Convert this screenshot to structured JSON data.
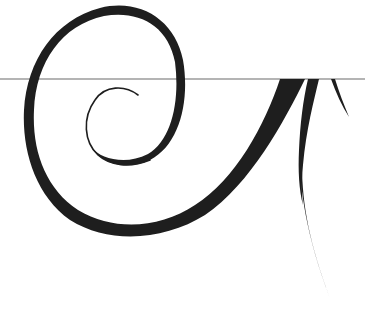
{
  "artwork": {
    "title": "Decorative swirl flourish",
    "colors": {
      "background": "#ffffff",
      "ink": "#1e1e1e",
      "rule": "#b4b4b4"
    },
    "elements": [
      {
        "name": "horizontal-rule",
        "y": 79
      },
      {
        "name": "outer-spiral-stroke"
      },
      {
        "name": "inner-spiral-stroke"
      },
      {
        "name": "diagonal-thick-stroke"
      },
      {
        "name": "tapering-tail-stroke"
      },
      {
        "name": "short-thorn-stroke"
      }
    ]
  }
}
